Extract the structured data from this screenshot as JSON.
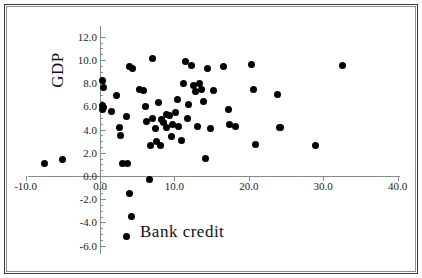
{
  "chart_data": {
    "type": "scatter",
    "title": "",
    "xlabel": "Bank credit",
    "ylabel": "GDP",
    "xlim": [
      -10.0,
      40.0
    ],
    "ylim": [
      -6.0,
      12.0
    ],
    "x_ticks": [
      "-10.0",
      "0.0",
      "10.0",
      "20.0",
      "30.0",
      "40.0"
    ],
    "x_tick_values": [
      -10.0,
      0.0,
      10.0,
      20.0,
      30.0,
      40.0
    ],
    "y_ticks": [
      "12.0",
      "10.0",
      "8.0",
      "6.0",
      "4.0",
      "2.0",
      "0.0",
      "-2.0",
      "-4.0",
      "-6.0"
    ],
    "y_tick_values": [
      12.0,
      10.0,
      8.0,
      6.0,
      4.0,
      2.0,
      0.0,
      -2.0,
      -4.0,
      -6.0
    ],
    "grid": false,
    "legend": null,
    "marker": "filled-circle",
    "marker_color": "#000000",
    "axis_color": "#8a8a8a",
    "points": [
      [
        -7.5,
        1.1
      ],
      [
        -5.0,
        1.4
      ],
      [
        0.4,
        8.2
      ],
      [
        0.5,
        7.6
      ],
      [
        0.3,
        6.1
      ],
      [
        0.5,
        5.9
      ],
      [
        0.4,
        5.7
      ],
      [
        1.5,
        5.6
      ],
      [
        2.2,
        6.9
      ],
      [
        2.6,
        4.2
      ],
      [
        2.8,
        3.5
      ],
      [
        3.0,
        1.1
      ],
      [
        3.7,
        1.1
      ],
      [
        3.6,
        5.1
      ],
      [
        3.9,
        -1.5
      ],
      [
        4.0,
        9.4
      ],
      [
        4.4,
        9.3
      ],
      [
        4.3,
        -3.5
      ],
      [
        3.5,
        -5.2
      ],
      [
        5.3,
        7.5
      ],
      [
        5.9,
        7.4
      ],
      [
        6.1,
        6.0
      ],
      [
        6.2,
        4.7
      ],
      [
        6.6,
        -0.3
      ],
      [
        6.8,
        2.6
      ],
      [
        7.0,
        5.0
      ],
      [
        7.1,
        10.1
      ],
      [
        7.4,
        4.1
      ],
      [
        7.6,
        3.0
      ],
      [
        7.9,
        6.3
      ],
      [
        8.1,
        2.6
      ],
      [
        8.3,
        4.9
      ],
      [
        8.6,
        4.6
      ],
      [
        8.9,
        5.3
      ],
      [
        9.0,
        4.2
      ],
      [
        9.3,
        5.2
      ],
      [
        9.6,
        3.4
      ],
      [
        9.8,
        4.4
      ],
      [
        10.1,
        5.5
      ],
      [
        10.4,
        6.6
      ],
      [
        10.6,
        4.3
      ],
      [
        10.9,
        3.1
      ],
      [
        11.2,
        8.0
      ],
      [
        11.5,
        9.9
      ],
      [
        11.7,
        5.0
      ],
      [
        11.9,
        6.2
      ],
      [
        12.3,
        9.5
      ],
      [
        12.6,
        7.8
      ],
      [
        12.9,
        7.3
      ],
      [
        13.1,
        4.3
      ],
      [
        13.4,
        8.0
      ],
      [
        13.6,
        7.5
      ],
      [
        13.9,
        6.4
      ],
      [
        14.2,
        1.5
      ],
      [
        14.4,
        9.3
      ],
      [
        14.8,
        4.1
      ],
      [
        15.3,
        7.4
      ],
      [
        16.6,
        9.4
      ],
      [
        17.3,
        5.7
      ],
      [
        17.4,
        4.4
      ],
      [
        18.2,
        4.3
      ],
      [
        20.4,
        9.6
      ],
      [
        20.6,
        7.5
      ],
      [
        20.9,
        2.7
      ],
      [
        23.8,
        7.0
      ],
      [
        24.1,
        4.2
      ],
      [
        24.3,
        4.2
      ],
      [
        28.9,
        2.6
      ],
      [
        32.6,
        9.5
      ]
    ]
  }
}
